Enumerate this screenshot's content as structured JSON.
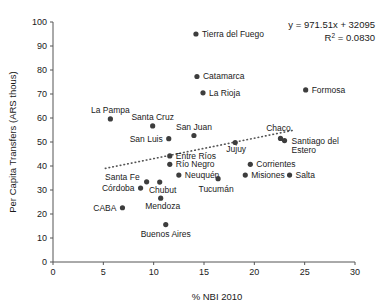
{
  "chart_data": {
    "type": "scatter",
    "title": "",
    "xlabel": "% NBI 2010",
    "ylabel": "Per Capita Transfers (ARS thous)",
    "xlim": [
      0,
      30
    ],
    "ylim": [
      0,
      100
    ],
    "xticks": [
      0,
      5,
      10,
      15,
      20,
      25,
      30
    ],
    "yticks": [
      0,
      10,
      20,
      30,
      40,
      50,
      60,
      70,
      80,
      90,
      100
    ],
    "grid": false,
    "legend": "none",
    "annotations": {
      "equation": "y = 971.51x + 32095",
      "r_squared_prefix": "R",
      "r_squared_sup": "2",
      "r_squared_value": " = 0.0830"
    },
    "trendline": {
      "type": "dotted",
      "x_start": 5.2,
      "y_start": 39.0,
      "x_end": 24.0,
      "y_end": 55.0
    },
    "points": [
      {
        "name": "Tierra del Fuego",
        "x": 14.2,
        "y": 95.0,
        "label_dx": 6,
        "label_dy": 3,
        "anchor": "start"
      },
      {
        "name": "Catamarca",
        "x": 14.3,
        "y": 77.3,
        "label_dx": 6,
        "label_dy": 3,
        "anchor": "start"
      },
      {
        "name": "La Rioja",
        "x": 14.9,
        "y": 70.5,
        "label_dx": 6,
        "label_dy": 3,
        "anchor": "start"
      },
      {
        "name": "Formosa",
        "x": 25.1,
        "y": 71.7,
        "label_dx": 6,
        "label_dy": 3,
        "anchor": "start"
      },
      {
        "name": "La Pampa",
        "x": 5.7,
        "y": 59.6,
        "label_dx": 0,
        "label_dy": -6,
        "anchor": "middle"
      },
      {
        "name": "Santa Cruz",
        "x": 9.9,
        "y": 56.7,
        "label_dx": 0,
        "label_dy": -6,
        "anchor": "middle"
      },
      {
        "name": "San Juan",
        "x": 14.0,
        "y": 52.7,
        "label_dx": 0,
        "label_dy": -6,
        "anchor": "middle"
      },
      {
        "name": "Chaco",
        "x": 22.6,
        "y": 51.5,
        "label_dx": -2,
        "label_dy": -7,
        "anchor": "middle"
      },
      {
        "name": "San Luis",
        "x": 11.5,
        "y": 51.4,
        "label_dx": -6,
        "label_dy": 3,
        "anchor": "end"
      },
      {
        "name": "Santiago del Estero",
        "x": 23.0,
        "y": 50.6,
        "label_dx": 7,
        "label_dy": 3,
        "anchor": "start"
      },
      {
        "name": "Jujuy",
        "x": 18.1,
        "y": 49.8,
        "label_dx": 1,
        "label_dy": 10,
        "anchor": "middle"
      },
      {
        "name": "Entre Ríos",
        "x": 11.6,
        "y": 44.2,
        "label_dx": 6,
        "label_dy": 3,
        "anchor": "start"
      },
      {
        "name": "Corrientes",
        "x": 19.6,
        "y": 40.7,
        "label_dx": 6,
        "label_dy": 3,
        "anchor": "start"
      },
      {
        "name": "Río Negro",
        "x": 11.6,
        "y": 40.7,
        "label_dx": 6,
        "label_dy": 3,
        "anchor": "start"
      },
      {
        "name": "Neuquén",
        "x": 12.5,
        "y": 36.2,
        "label_dx": 6,
        "label_dy": 3,
        "anchor": "start"
      },
      {
        "name": "Misiones",
        "x": 19.1,
        "y": 36.2,
        "label_dx": 6,
        "label_dy": 3,
        "anchor": "start"
      },
      {
        "name": "Salta",
        "x": 23.5,
        "y": 36.2,
        "label_dx": 6,
        "label_dy": 3,
        "anchor": "start"
      },
      {
        "name": "Tucumán",
        "x": 16.4,
        "y": 34.7,
        "label_dx": -2,
        "label_dy": 13,
        "anchor": "middle"
      },
      {
        "name": "Santa Fe",
        "x": 9.3,
        "y": 33.4,
        "label_dx": -7,
        "label_dy": -2,
        "anchor": "end"
      },
      {
        "name": "Chubut",
        "x": 10.6,
        "y": 33.3,
        "label_dx": 3,
        "label_dy": 11,
        "anchor": "middle"
      },
      {
        "name": "Córdoba",
        "x": 8.7,
        "y": 30.8,
        "label_dx": -6,
        "label_dy": 3,
        "anchor": "end"
      },
      {
        "name": "Mendoza",
        "x": 10.7,
        "y": 26.6,
        "label_dx": 2,
        "label_dy": 11,
        "anchor": "middle"
      },
      {
        "name": "CABA",
        "x": 6.9,
        "y": 22.6,
        "label_dx": -6,
        "label_dy": 3,
        "anchor": "end"
      },
      {
        "name": "Buenos Aires",
        "x": 11.2,
        "y": 15.6,
        "label_dx": 0,
        "label_dy": 12,
        "anchor": "middle"
      }
    ]
  }
}
